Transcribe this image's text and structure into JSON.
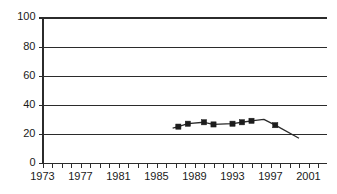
{
  "chart_data": {
    "type": "line",
    "title": "",
    "subtitle": "",
    "xlabel": "",
    "ylabel": "",
    "xlim": [
      1972,
      2002
    ],
    "ylim": [
      0,
      100
    ],
    "grid": true,
    "legend": "none",
    "y_ticks": [
      0,
      20,
      40,
      60,
      80,
      100
    ],
    "y_tick_labels": [
      "0",
      "20",
      "40",
      "60",
      "80",
      "100"
    ],
    "x_tick_labels": [
      "1973",
      "1977",
      "1981",
      "1985",
      "1989",
      "1993",
      "1997",
      "2001"
    ],
    "x_tick_values": [
      1973,
      1977,
      1981,
      1985,
      1989,
      1993,
      1997,
      2001
    ],
    "x_minor_tick_step": 1,
    "series": [
      {
        "name": "series-1",
        "marker": "square",
        "marker_color": "#1c1c1c",
        "line_color": "#2b2b2b",
        "x": [
          1986.7,
          1987.3,
          1988.3,
          1990.0,
          1991.0,
          1993.0,
          1994.0,
          1995.0,
          1996.3,
          1997.5,
          2000.0
        ],
        "y": [
          24,
          25,
          27,
          28,
          26.5,
          27,
          28,
          29,
          30,
          26,
          17
        ],
        "marker_points": [
          {
            "x": 1987.3,
            "y": 25
          },
          {
            "x": 1988.3,
            "y": 27
          },
          {
            "x": 1990.0,
            "y": 28
          },
          {
            "x": 1991.0,
            "y": 26.5
          },
          {
            "x": 1993.0,
            "y": 27
          },
          {
            "x": 1994.0,
            "y": 28
          },
          {
            "x": 1995.0,
            "y": 29
          },
          {
            "x": 1997.5,
            "y": 26
          }
        ]
      }
    ]
  },
  "colors": {
    "axis": "#2b2b2b",
    "grid": "#2b2b2b",
    "marker": "#1c1c1c",
    "background": "#ffffff"
  }
}
